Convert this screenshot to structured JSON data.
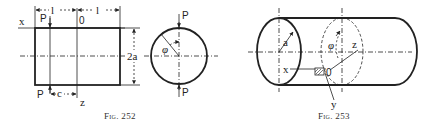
{
  "figures": [
    {
      "id": "fig252",
      "caption": "Fig. 252",
      "labels": {
        "x_axis": "x",
        "z_axis": "z",
        "origin": "0",
        "load_top": "P",
        "load_bottom": "P",
        "length_left": "l",
        "length_right": "l",
        "offset": "c",
        "height": "2a",
        "circle_load_top": "P",
        "circle_load_bottom": "P",
        "angle": "φ",
        "radius_marker": "r"
      }
    },
    {
      "id": "fig253",
      "caption": "Fig. 253",
      "labels": {
        "radius": "a",
        "angle": "φ",
        "x_axis": "x",
        "y_axis": "y",
        "z_axis": "z",
        "origin": "0"
      }
    }
  ]
}
